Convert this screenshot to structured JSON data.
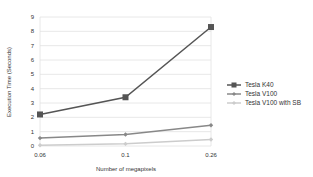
{
  "chart_data": {
    "type": "line",
    "title": "",
    "xlabel": "Number of megapixels",
    "ylabel": "Execution Time (Seconds)",
    "categories": [
      "0.06",
      "0.1",
      "0.26"
    ],
    "ylim": [
      0,
      9
    ],
    "yticks": [
      "0",
      "1",
      "2",
      "3",
      "4",
      "5",
      "6",
      "7",
      "8",
      "9"
    ],
    "grid": true,
    "legend": "right",
    "series": [
      {
        "name": "Tesla K40",
        "values": [
          2.2,
          3.4,
          8.3
        ],
        "color": "#555555",
        "marker": "square"
      },
      {
        "name": "Tesla V100",
        "values": [
          0.55,
          0.8,
          1.45
        ],
        "color": "#888888",
        "marker": "diamond"
      },
      {
        "name": "Tesla V100 with SB",
        "values": [
          0.05,
          0.15,
          0.45
        ],
        "color": "#cccccc",
        "marker": "diamond"
      }
    ]
  }
}
